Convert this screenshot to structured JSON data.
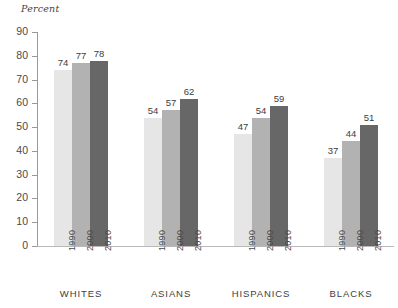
{
  "chart_data": {
    "type": "bar",
    "title": "",
    "subtitle": "",
    "ylabel": "Percent",
    "xlabel": "",
    "ylim": [
      0,
      90
    ],
    "yticks": [
      0,
      10,
      20,
      30,
      40,
      50,
      60,
      70,
      80,
      90
    ],
    "grid": false,
    "legend": "none",
    "orientation": "vertical",
    "grouped": true,
    "categories": [
      "WHITES",
      "ASIANS",
      "HISPANICS",
      "BLACKS"
    ],
    "series": [
      {
        "name": "1990",
        "values": [
          74,
          54,
          47,
          37
        ],
        "color": "#e6e6e6"
      },
      {
        "name": "2000",
        "values": [
          77,
          57,
          54,
          44
        ],
        "color": "#b2b2b2"
      },
      {
        "name": "2010",
        "values": [
          78,
          62,
          59,
          51
        ],
        "color": "#676767"
      }
    ],
    "value_labels": [
      [
        74,
        77,
        78
      ],
      [
        54,
        57,
        62
      ],
      [
        47,
        54,
        59
      ],
      [
        37,
        44,
        51
      ]
    ],
    "annotations": []
  }
}
